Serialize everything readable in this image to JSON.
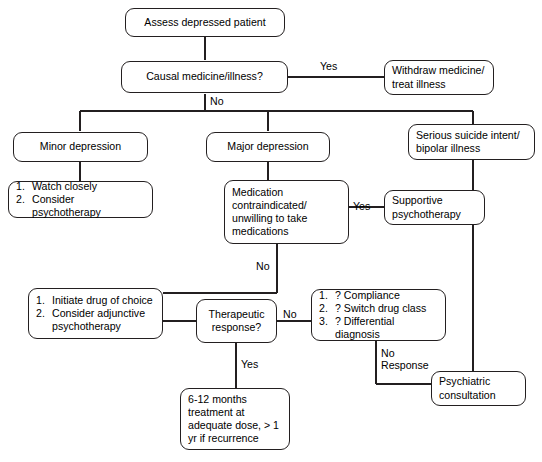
{
  "diagram": {
    "line_color": "#231f20",
    "background": "#ffffff",
    "nodes": {
      "assess": {
        "text": "Assess depressed patient"
      },
      "causal": {
        "text": "Causal medicine/illness?"
      },
      "withdraw": {
        "line1": "Withdraw medicine/",
        "line2": "treat illness"
      },
      "minor": {
        "text": "Minor depression"
      },
      "major": {
        "text": "Major depression"
      },
      "serious": {
        "line1": "Serious suicide intent/",
        "line2": "bipolar illness"
      },
      "minor_plan": {
        "items": [
          {
            "num": "1.",
            "text": "Watch closely"
          },
          {
            "num": "2.",
            "text": "Consider psychotherapy"
          }
        ]
      },
      "medication": {
        "line1": "Medication",
        "line2": "contraindicated/",
        "line3": "unwilling to take",
        "line4": "medications"
      },
      "supportive": {
        "line1": "Supportive",
        "line2": "psychotherapy"
      },
      "initiate": {
        "items": [
          {
            "num": "1.",
            "text": "Initiate drug of choice"
          },
          {
            "num": "2.",
            "text": "Consider adjunctive psychotherapy"
          }
        ]
      },
      "therapeutic": {
        "line1": "Therapeutic",
        "line2": "response?"
      },
      "compliance": {
        "items": [
          {
            "num": "1.",
            "text": "? Compliance"
          },
          {
            "num": "2.",
            "text": "? Switch drug class"
          },
          {
            "num": "3.",
            "text": "? Differential diagnosis"
          }
        ]
      },
      "psychiatric": {
        "line1": "Psychiatric",
        "line2": "consultation"
      },
      "maintenance": {
        "line1": "6-12 months",
        "line2": "treatment at",
        "line3": "adequate dose, > 1",
        "line4": "yr if recurrence"
      }
    },
    "edge_labels": {
      "causal_yes": "Yes",
      "causal_no": "No",
      "medication_yes": "Yes",
      "medication_no": "No",
      "therapeutic_no": "No",
      "therapeutic_yes": "Yes",
      "no_response_l1": "No",
      "no_response_l2": "Response"
    }
  }
}
